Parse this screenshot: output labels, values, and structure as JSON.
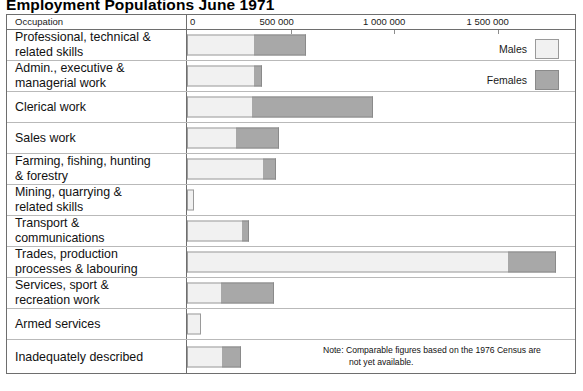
{
  "title": "Employment Populations June 1971",
  "header": {
    "occupation_label": "Occupation"
  },
  "legend": {
    "males_label": "Males",
    "females_label": "Females",
    "males_color": "#f1f1f1",
    "females_color": "#a8a8a8"
  },
  "note": {
    "line1": "Note: Comparable figures based on the 1976 Census are",
    "line2": "not yet available."
  },
  "chart_data": {
    "type": "bar",
    "orientation": "horizontal",
    "stacked": true,
    "title": "Employment Populations June 1971",
    "xlabel": "",
    "ylabel": "Occupation",
    "xlim": [
      0,
      1900000
    ],
    "xticks": [
      0,
      500000,
      1000000,
      1500000
    ],
    "xtick_labels": [
      "0",
      "500 000",
      "1 000 000",
      "1 500 000"
    ],
    "grid": false,
    "legend_position": "top-right",
    "categories": [
      "Professional, technical & related skills",
      "Admin., executive & managerial work",
      "Clerical work",
      "Sales work",
      "Farming, fishing, hunting & forestry",
      "Mining, quarrying & related skills",
      "Transport & communications",
      "Trades, production processes & labouring",
      "Services, sport & recreation work",
      "Armed services",
      "Inadequately described"
    ],
    "series": [
      {
        "name": "Males",
        "color": "#f1f1f1",
        "values": [
          325000,
          325000,
          315000,
          237000,
          368000,
          34000,
          266000,
          1552000,
          165000,
          68000,
          169000
        ]
      },
      {
        "name": "Females",
        "color": "#a8a8a8",
        "values": [
          251000,
          39000,
          585000,
          208000,
          63000,
          0,
          34000,
          232000,
          256000,
          0,
          92000
        ]
      }
    ],
    "totals": [
      576000,
      364000,
      900000,
      445000,
      431000,
      34000,
      300000,
      1784000,
      421000,
      68000,
      261000
    ]
  },
  "rows": [
    {
      "label": "Professional, technical &\nrelated skills",
      "males": 325000,
      "females": 251000
    },
    {
      "label": "Admin., executive &\nmanagerial work",
      "males": 325000,
      "females": 39000
    },
    {
      "label": "Clerical work",
      "males": 315000,
      "females": 585000
    },
    {
      "label": "Sales work",
      "males": 237000,
      "females": 208000
    },
    {
      "label": "Farming, fishing, hunting\n& forestry",
      "males": 368000,
      "females": 63000
    },
    {
      "label": "Mining, quarrying &\nrelated skills",
      "males": 34000,
      "females": 0
    },
    {
      "label": "Transport &\ncommunications",
      "males": 266000,
      "females": 34000
    },
    {
      "label": "Trades, production\nprocesses & labouring",
      "males": 1552000,
      "females": 232000
    },
    {
      "label": "Services, sport &\nrecreation work",
      "males": 165000,
      "females": 256000
    },
    {
      "label": "Armed services",
      "males": 68000,
      "females": 0
    },
    {
      "label": "Inadequately described",
      "males": 169000,
      "females": 92000
    }
  ]
}
